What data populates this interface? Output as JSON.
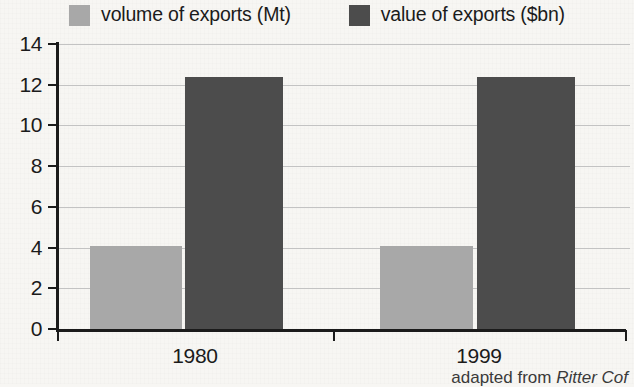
{
  "chart_data": {
    "type": "bar",
    "title": "",
    "subtitle": "",
    "xlabel": "",
    "ylabel": "",
    "categories": [
      "1980",
      "1999"
    ],
    "series": [
      {
        "name": "volume of exports (Mt)",
        "color": "#a8a8a8",
        "values": [
          4.1,
          4.1
        ]
      },
      {
        "name": "value of exports ($bn)",
        "color": "#4c4c4c",
        "values": [
          12.4,
          12.4
        ]
      }
    ],
    "ylim": [
      0,
      14
    ],
    "ytick_step": 2,
    "yticks": [
      0,
      2,
      4,
      6,
      8,
      10,
      12,
      14
    ],
    "ytick_labels": [
      "0",
      "2",
      "4",
      "6",
      "8",
      "10",
      "12",
      "14"
    ],
    "grid": true,
    "grid_axis": "y",
    "legend_position": "top-center",
    "annotations": []
  },
  "legend": {
    "entries": [
      {
        "label": "volume of exports (Mt)",
        "color": "#a8a8a8",
        "swatch_name": "legend-swatch-volume"
      },
      {
        "label": "value of exports ($bn)",
        "color": "#4c4c4c",
        "swatch_name": "legend-swatch-value"
      }
    ]
  },
  "axes": {
    "y": {
      "labels": [
        "14",
        "12",
        "10",
        "8",
        "6",
        "4",
        "2",
        "0"
      ]
    },
    "x": {
      "labels": [
        "1980",
        "1999"
      ]
    }
  },
  "caption": {
    "prefix": "adapted from ",
    "source": "Ritter Cof"
  },
  "colors": {
    "background": "#f7f6f3",
    "axis": "#1b1b1b",
    "gridline": "#c3c3c3",
    "series_light": "#a8a8a8",
    "series_dark": "#4c4c4c",
    "text": "#1b1b1b"
  }
}
